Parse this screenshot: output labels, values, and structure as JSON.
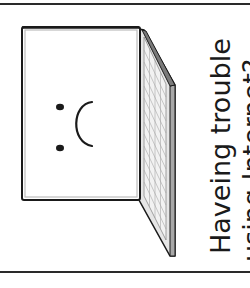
{
  "caption": {
    "line1": "Haveing trouble",
    "line2": "using Internet?"
  },
  "illustration": {
    "subject": "laptop-sad-face",
    "screen_face": ":(",
    "colors": {
      "outline": "#1a1a1a",
      "screen_fill": "#ffffff",
      "bezel": "#d8d8d8",
      "keyboard_fill": "#e6e6e6",
      "key_lines": "#9a9a9a",
      "edge_shadow": "#8c8c8c"
    }
  }
}
